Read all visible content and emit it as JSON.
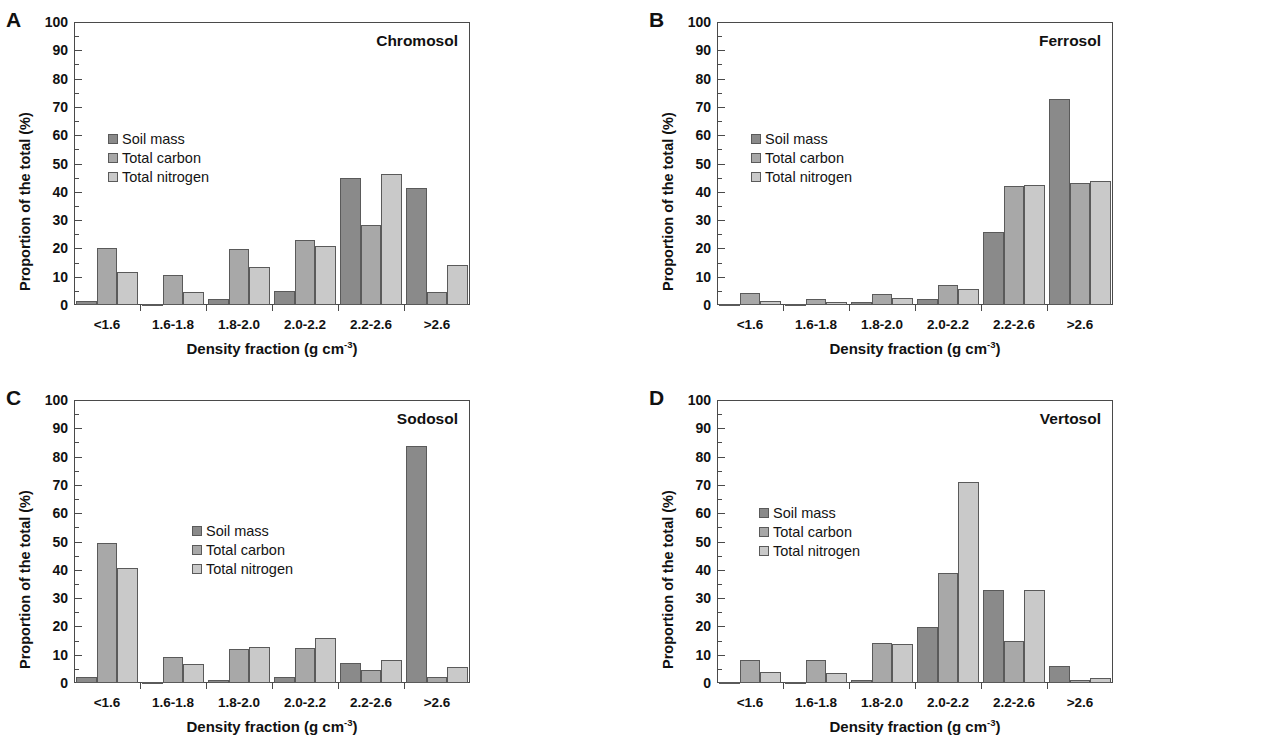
{
  "figure": {
    "background": "#ffffff",
    "axis_color": "#4a4a4a"
  },
  "series_colors": {
    "soil_mass": "#8a8a8a",
    "total_carbon": "#a8a8a8",
    "total_nitrogen": "#c9c9c9"
  },
  "legend": {
    "items": [
      {
        "label": "Soil mass",
        "key": "soil_mass"
      },
      {
        "label": "Total carbon",
        "key": "total_carbon"
      },
      {
        "label": "Total nitrogen",
        "key": "total_nitrogen"
      }
    ]
  },
  "axis": {
    "ylabel": "Proportion of the total (%)",
    "xlabel_text": "Density fraction (g cm",
    "xlabel_sup": "-3",
    "xlabel_tail": ")",
    "xlabel_full": "Density fraction (g cm-3)",
    "yticks": [
      "0",
      "10",
      "20",
      "30",
      "40",
      "50",
      "60",
      "70",
      "80",
      "90",
      "100"
    ],
    "ylim": [
      0,
      100
    ],
    "categories": [
      "<1.6",
      "1.6-1.8",
      "1.8-2.0",
      "2.0-2.2",
      "2.2-2.6",
      ">2.6"
    ]
  },
  "panels": [
    {
      "letter": "A",
      "title": "Chromosol",
      "title_pos": "right",
      "legend_pos": "left"
    },
    {
      "letter": "B",
      "title": "Ferrosol",
      "title_pos": "right",
      "legend_pos": "left"
    },
    {
      "letter": "C",
      "title": "Sodosol",
      "title_pos": "right",
      "legend_pos": "center"
    },
    {
      "letter": "D",
      "title": "Vertosol",
      "title_pos": "right",
      "legend_pos": "left"
    }
  ],
  "chart_data": [
    {
      "type": "bar",
      "panel": "A",
      "title": "Chromosol",
      "xlabel": "Density fraction (g cm-3)",
      "ylabel": "Proportion of the total (%)",
      "ylim": [
        0,
        100
      ],
      "grid": false,
      "legend_position": "inside-upper-left",
      "categories": [
        "<1.6",
        "1.6-1.8",
        "1.8-2.0",
        "2.0-2.2",
        "2.2-2.6",
        ">2.6"
      ],
      "series": [
        {
          "name": "Soil mass",
          "values": [
            1.3,
            0.5,
            2.0,
            4.8,
            45.0,
            41.5
          ]
        },
        {
          "name": "Total carbon",
          "values": [
            20.0,
            10.5,
            19.8,
            23.0,
            28.2,
            4.5
          ]
        },
        {
          "name": "Total nitrogen",
          "values": [
            11.8,
            4.5,
            13.5,
            21.0,
            46.3,
            14.2
          ]
        }
      ]
    },
    {
      "type": "bar",
      "panel": "B",
      "title": "Ferrosol",
      "xlabel": "Density fraction (g cm-3)",
      "ylabel": "Proportion of the total (%)",
      "ylim": [
        0,
        100
      ],
      "grid": false,
      "legend_position": "inside-upper-left",
      "categories": [
        "<1.6",
        "1.6-1.8",
        "1.8-2.0",
        "2.0-2.2",
        "2.2-2.6",
        ">2.6"
      ],
      "series": [
        {
          "name": "Soil mass",
          "values": [
            0.4,
            0.3,
            0.9,
            2.0,
            25.7,
            72.7
          ]
        },
        {
          "name": "Total carbon",
          "values": [
            4.2,
            2.0,
            3.8,
            7.2,
            42.2,
            43.2
          ]
        },
        {
          "name": "Total nitrogen",
          "values": [
            1.5,
            0.9,
            2.5,
            5.5,
            42.3,
            43.8
          ]
        }
      ]
    },
    {
      "type": "bar",
      "panel": "C",
      "title": "Sodosol",
      "xlabel": "Density fraction (g cm-3)",
      "ylabel": "Proportion of the total (%)",
      "ylim": [
        0,
        100
      ],
      "grid": false,
      "legend_position": "inside-center",
      "categories": [
        "<1.6",
        "1.6-1.8",
        "1.8-2.0",
        "2.0-2.2",
        "2.2-2.6",
        ">2.6"
      ],
      "series": [
        {
          "name": "Soil mass",
          "values": [
            2.2,
            0.5,
            1.2,
            2.0,
            7.0,
            83.8
          ]
        },
        {
          "name": "Total carbon",
          "values": [
            49.5,
            9.2,
            12.0,
            12.2,
            4.5,
            2.0
          ]
        },
        {
          "name": "Total nitrogen",
          "values": [
            40.8,
            6.8,
            12.8,
            16.0,
            8.2,
            5.5
          ]
        }
      ]
    },
    {
      "type": "bar",
      "panel": "D",
      "title": "Vertosol",
      "xlabel": "Density fraction (g cm-3)",
      "ylabel": "Proportion of the total (%)",
      "ylim": [
        0,
        100
      ],
      "grid": false,
      "legend_position": "inside-upper-left",
      "categories": [
        "<1.6",
        "1.6-1.8",
        "1.8-2.0",
        "2.0-2.2",
        "2.2-2.6",
        ">2.6"
      ],
      "series": [
        {
          "name": "Soil mass",
          "values": [
            0.4,
            0.4,
            1.2,
            19.7,
            33.0,
            6.0
          ]
        },
        {
          "name": "Total carbon",
          "values": [
            8.0,
            8.3,
            14.2,
            39.0,
            15.0,
            1.0
          ]
        },
        {
          "name": "Total nitrogen",
          "values": [
            3.8,
            3.7,
            13.8,
            71.2,
            33.0,
            1.7
          ]
        }
      ]
    }
  ]
}
